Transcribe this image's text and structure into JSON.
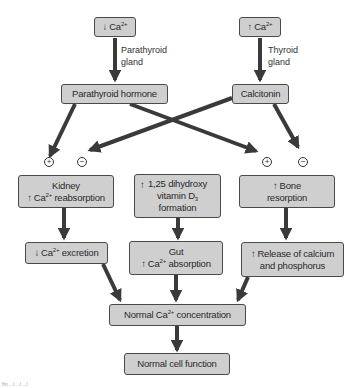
{
  "diagram": {
    "nodes": {
      "low_ca": {
        "arrow": "down",
        "text": "Ca",
        "sup": "2+"
      },
      "high_ca": {
        "arrow": "up",
        "text": "Ca",
        "sup": "2+"
      },
      "pth": {
        "text": "Parathyroid hormone"
      },
      "calcitonin": {
        "text": "Calcitonin"
      },
      "kidney": {
        "line1": "Kidney",
        "line2_arrow": "up",
        "line2_pre": "Ca",
        "line2_sup": "2+",
        "line2_post": " reabsorption"
      },
      "vitd": {
        "arrow": "up",
        "line1": "1,25 dihydroxy",
        "line2_pre": "vitamin D",
        "line2_sub": "3",
        "line3": "formation"
      },
      "bone": {
        "arrow": "up",
        "line1": "Bone",
        "line2": "resorption"
      },
      "excretion": {
        "arrow": "down",
        "pre": "Ca",
        "sup": "2+",
        "post": " excretion"
      },
      "gut": {
        "line1": "Gut",
        "line2_arrow": "up",
        "line2_pre": "Ca",
        "line2_sup": "2+",
        "line2_post": " absorption"
      },
      "release": {
        "arrow": "up",
        "line1": "Release of calcium",
        "line2": "and phosphorus"
      },
      "normal_ca": {
        "pre": "Normal Ca",
        "sup": "2+",
        "post": " concentration"
      },
      "normal_cell": {
        "text": "Normal cell function"
      }
    },
    "edge_labels": {
      "parathyroid_gland": [
        "Parathyroid",
        "gland"
      ],
      "thyroid_gland": [
        "Thyroid",
        "gland"
      ]
    },
    "signs": {
      "kidney_plus": "+",
      "kidney_minus": "−",
      "bone_plus": "+",
      "bone_minus": "−"
    },
    "caption": "fm ...l ...l ...l"
  }
}
